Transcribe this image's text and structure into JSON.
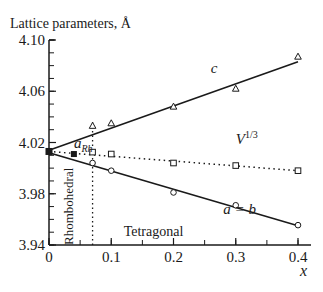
{
  "chart_data": {
    "type": "line",
    "title": "",
    "ylabel": "Lattice parameters, Å",
    "xlabel": "x",
    "xlim": [
      0,
      0.4
    ],
    "ylim": [
      3.94,
      4.1
    ],
    "x_ticks": [
      0,
      0.1,
      0.2,
      0.3,
      0.4
    ],
    "x_tick_labels": [
      "0",
      "0.1",
      "0.2",
      "0.3",
      "0.4"
    ],
    "x_minor_step": 0.05,
    "y_ticks": [
      3.94,
      3.98,
      4.02,
      4.06,
      4.1
    ],
    "y_tick_labels": [
      "3.94",
      "3.98",
      "4.02",
      "4.06",
      "4.10"
    ],
    "y_minor_step": 0.01,
    "grid": false,
    "series": [
      {
        "name": "c",
        "marker": "triangle-open",
        "line": "solid",
        "points": [
          [
            0.07,
            4.033
          ],
          [
            0.1,
            4.035
          ],
          [
            0.2,
            4.048
          ],
          [
            0.3,
            4.062
          ],
          [
            0.4,
            4.087
          ]
        ],
        "fit": [
          [
            0,
            4.014
          ],
          [
            0.4,
            4.083
          ]
        ]
      },
      {
        "name": "V^1/3",
        "marker": "square-open",
        "line": "dotted",
        "points": [
          [
            0.07,
            4.0125
          ],
          [
            0.1,
            4.011
          ],
          [
            0.2,
            4.004
          ],
          [
            0.3,
            4.002
          ],
          [
            0.4,
            3.998
          ]
        ],
        "fit": [
          [
            0,
            4.013
          ],
          [
            0.4,
            3.998
          ]
        ]
      },
      {
        "name": "a = b",
        "marker": "circle-open",
        "line": "solid",
        "points": [
          [
            0.07,
            4.004
          ],
          [
            0.1,
            3.998
          ],
          [
            0.2,
            3.981
          ],
          [
            0.3,
            3.971
          ],
          [
            0.4,
            3.9555
          ]
        ],
        "fit": [
          [
            0,
            4.012
          ],
          [
            0.4,
            3.955
          ]
        ]
      },
      {
        "name": "a_Rh",
        "marker": "square-filled",
        "line": "none",
        "points": [
          [
            0,
            4.013
          ],
          [
            0.04,
            4.011
          ]
        ]
      }
    ],
    "phase_boundary_x": 0.07,
    "annotations": [
      {
        "id": "c",
        "text": "c",
        "x": 0.26,
        "y": 4.074
      },
      {
        "id": "v",
        "text": "V",
        "sup": "1/3",
        "x": 0.3,
        "y": 4.019
      },
      {
        "id": "ab",
        "text": "a = b",
        "x": 0.28,
        "y": 3.964
      },
      {
        "id": "arh",
        "text": "a",
        "sub": "Rh",
        "x": 0.04,
        "y": 4.016
      },
      {
        "id": "tetragonal",
        "text": "Tetragonal",
        "x": 0.12,
        "y": 3.947
      },
      {
        "id": "rhombohedral",
        "text": "Rhombohedral",
        "x": 0.03,
        "y": 3.94
      }
    ]
  }
}
